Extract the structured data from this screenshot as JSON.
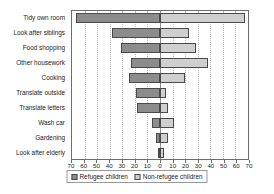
{
  "chart_data": {
    "type": "bar",
    "orientation": "horizontal-diverging",
    "title": "",
    "xlabel": "",
    "ylabel": "",
    "axis_max": 70,
    "tick_labels": [
      "70",
      "60",
      "50",
      "40",
      "30",
      "20",
      "10",
      "0",
      "10",
      "20",
      "30",
      "40",
      "50",
      "60",
      "70"
    ],
    "tick_step": 10,
    "grid": true,
    "legend_position": "bottom-center",
    "categories": [
      "Tidy own room",
      "Look after siblings",
      "Food shopping",
      "Other housework",
      "Cooking",
      "Translate outside",
      "Translate letters",
      "Wash car",
      "Gardening",
      "Look after elderly"
    ],
    "series": [
      {
        "name": "Refugee children",
        "side": "left",
        "color": "#8c8c8c",
        "values": [
          67,
          38,
          31,
          23,
          25,
          19,
          18,
          6,
          3,
          1
        ]
      },
      {
        "name": "Non-refugee children",
        "side": "right",
        "color": "#cfcfcf",
        "values": [
          68,
          23,
          29,
          38,
          20,
          5,
          6,
          11,
          6,
          3
        ]
      }
    ]
  },
  "legend": {
    "refugee_label": "Refugee children",
    "nonrefugee_label": "Non-refugee children"
  }
}
